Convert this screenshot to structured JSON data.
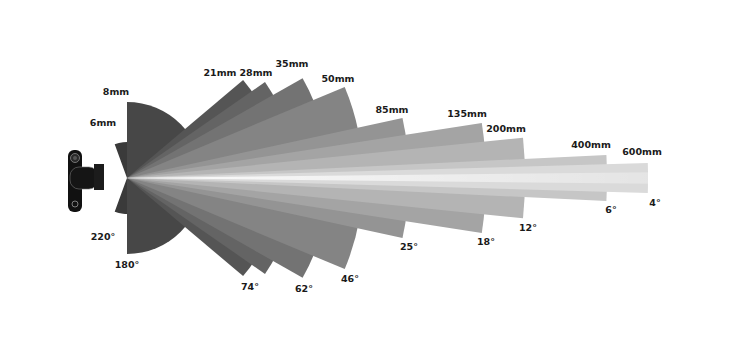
{
  "diagram": {
    "apex": {
      "x": 127,
      "y": 178
    },
    "camera_icon": "camera-side-view-icon",
    "lenses": [
      {
        "focal": "6mm",
        "angle": "220°",
        "half_angle_deg": 110,
        "radius": 36,
        "color": "#3a3a3a"
      },
      {
        "focal": "8mm",
        "angle": "180°",
        "half_angle_deg": 90,
        "radius": 76,
        "color": "#474747"
      },
      {
        "focal": "21mm",
        "angle": "",
        "half_angle_deg": 40.2,
        "radius": 152,
        "color": "#555555"
      },
      {
        "focal": "28mm",
        "angle": "74°",
        "half_angle_deg": 34.8,
        "radius": 168,
        "color": "#646464"
      },
      {
        "focal": "35mm",
        "angle": "62°",
        "half_angle_deg": 29.6,
        "radius": 202,
        "color": "#737373"
      },
      {
        "focal": "50mm",
        "angle": "46°",
        "half_angle_deg": 22.7,
        "radius": 236,
        "color": "#848484"
      },
      {
        "focal": "85mm",
        "angle": "25°",
        "half_angle_deg": 12.3,
        "radius": 282,
        "color": "#949494"
      },
      {
        "focal": "135mm",
        "angle": "18°",
        "half_angle_deg": 8.8,
        "radius": 359,
        "color": "#a4a4a4"
      },
      {
        "focal": "200mm",
        "angle": "12°",
        "half_angle_deg": 5.8,
        "radius": 398,
        "color": "#b4b4b4"
      },
      {
        "focal": "400mm",
        "angle": "6°",
        "half_angle_deg": 2.75,
        "radius": 480,
        "color": "#c6c6c6"
      },
      {
        "focal": "600mm",
        "angle": "4°",
        "half_angle_deg": 1.65,
        "radius": 521,
        "color": "#dadada"
      }
    ],
    "labels": {
      "focal": [
        {
          "text": "6mm",
          "x": 103,
          "y": 126
        },
        {
          "text": "8mm",
          "x": 116,
          "y": 95
        },
        {
          "text": "21mm",
          "x": 220,
          "y": 76
        },
        {
          "text": "28mm",
          "x": 256,
          "y": 76
        },
        {
          "text": "35mm",
          "x": 292,
          "y": 67
        },
        {
          "text": "50mm",
          "x": 338,
          "y": 82
        },
        {
          "text": "85mm",
          "x": 392,
          "y": 113
        },
        {
          "text": "135mm",
          "x": 467,
          "y": 117
        },
        {
          "text": "200mm",
          "x": 506,
          "y": 132
        },
        {
          "text": "400mm",
          "x": 591,
          "y": 148
        },
        {
          "text": "600mm",
          "x": 642,
          "y": 155
        }
      ],
      "angle": [
        {
          "text": "220°",
          "x": 103,
          "y": 240
        },
        {
          "text": "180°",
          "x": 127,
          "y": 268
        },
        {
          "text": "74°",
          "x": 250,
          "y": 290
        },
        {
          "text": "62°",
          "x": 304,
          "y": 292
        },
        {
          "text": "46°",
          "x": 350,
          "y": 282
        },
        {
          "text": "25°",
          "x": 409,
          "y": 250
        },
        {
          "text": "18°",
          "x": 486,
          "y": 245
        },
        {
          "text": "12°",
          "x": 528,
          "y": 231
        },
        {
          "text": "6°",
          "x": 611,
          "y": 213
        },
        {
          "text": "4°",
          "x": 655,
          "y": 206
        }
      ]
    }
  }
}
